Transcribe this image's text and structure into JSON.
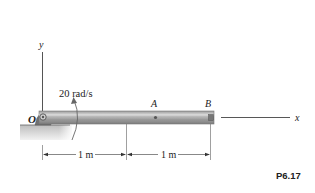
{
  "figure": {
    "id_label": "P6.17",
    "axes": {
      "x_label": "x",
      "y_label": "y"
    },
    "pivot": {
      "label": "O"
    },
    "angular_velocity": {
      "label": "20 rad/s"
    },
    "points": [
      {
        "label": "A"
      },
      {
        "label": "B"
      }
    ],
    "dimensions": [
      {
        "label": "1 m"
      },
      {
        "label": "1 m"
      }
    ],
    "colors": {
      "bar": "#b0b0b0",
      "bar_dark": "#8a8a8a",
      "ground": "#c8c8c8",
      "line": "#444444"
    }
  }
}
